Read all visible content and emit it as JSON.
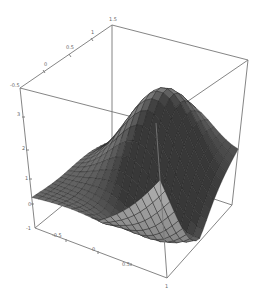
{
  "chart_data": {
    "type": "surface3d",
    "title": "",
    "xlabel": "",
    "ylabel": "",
    "zlabel": "",
    "function_description": "smooth saddle-like surface with a single peak near the back-right and a deep trough at front-left",
    "x_range": [
      -1,
      1
    ],
    "y_range": [
      -1,
      1
    ],
    "z_range": [
      -0.5,
      1.5
    ],
    "x_ticks": [
      "-1",
      "-0.5",
      "0",
      "0.5",
      "1"
    ],
    "y_ticks": [
      "-1",
      "-0.5",
      "0",
      "0.5",
      "1"
    ],
    "z_ticks": [
      "-0.5",
      "0",
      "0.5",
      "1",
      "1.5"
    ],
    "grid_resolution": 20,
    "colors": {
      "surface_dark": "#2a2a2a",
      "surface_light": "#a8a8a8",
      "mesh_line": "#1a1a1a",
      "box": "#777777",
      "tick_text": "#666666",
      "background": "#ffffff"
    },
    "box_corners_px": {
      "top_back": [
        112,
        25
      ],
      "top_left": [
        20,
        88
      ],
      "top_right": [
        248,
        60
      ],
      "top_front": [
        156,
        123
      ],
      "bottom_back": [
        112,
        165
      ],
      "bottom_left": [
        35,
        228
      ],
      "bottom_right": [
        232,
        205
      ],
      "bottom_front": [
        167,
        278
      ]
    }
  },
  "axis_labels": {
    "top_edge": [
      {
        "text": "-0.5",
        "x": 10,
        "y": 87
      },
      {
        "text": "0",
        "x": 44,
        "y": 66
      },
      {
        "text": "0.5",
        "x": 66,
        "y": 49
      },
      {
        "text": "1",
        "x": 91,
        "y": 34
      },
      {
        "text": "1.5",
        "x": 109,
        "y": 21
      }
    ],
    "vertical_edge": [
      {
        "text": "3",
        "x": 17,
        "y": 116
      },
      {
        "text": "2",
        "x": 22,
        "y": 150
      },
      {
        "text": "1",
        "x": 27,
        "y": 180
      },
      {
        "text": "0",
        "x": 30,
        "y": 206
      },
      {
        "text": "-1",
        "x": 26,
        "y": 229
      }
    ],
    "bottom_edge": [
      {
        "text": "-0.5",
        "x": 52,
        "y": 236
      },
      {
        "text": "0",
        "x": 92,
        "y": 250
      },
      {
        "text": "0.5",
        "x": 121,
        "y": 265
      },
      {
        "text": "1",
        "x": 165,
        "y": 286
      }
    ]
  }
}
